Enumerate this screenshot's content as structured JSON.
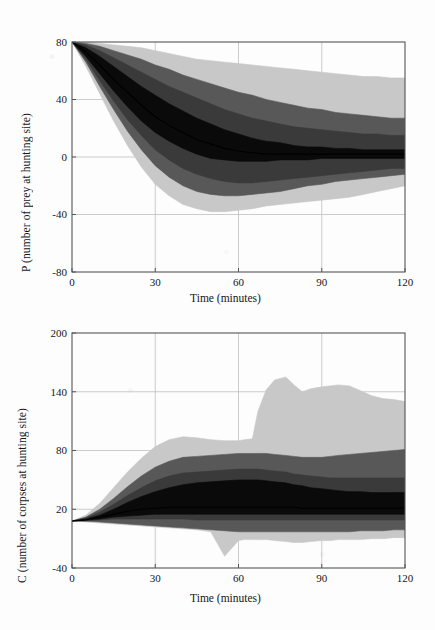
{
  "figure": {
    "background_color": "#fdfdfd",
    "band_colors": {
      "outer": "#c8c8c8",
      "mid": "#585858",
      "inner": "#3a3a3a",
      "core": "#0a0a0a",
      "median": "#000000",
      "grid": "#bfbfbf",
      "axis": "#555555"
    }
  },
  "chart_data": [
    {
      "id": "prey-panel",
      "type": "area",
      "title": "",
      "xlabel": "Time (minutes)",
      "ylabel": "P (number of prey at hunting site)",
      "xlim": [
        0,
        120
      ],
      "ylim": [
        -80,
        80
      ],
      "xticks": [
        0,
        30,
        60,
        90,
        120
      ],
      "yticks": [
        -80,
        -40,
        0,
        40,
        80
      ],
      "xtick_labels": [
        "0",
        "30",
        "60",
        "90",
        "120"
      ],
      "ytick_labels": [
        "-80",
        "-40",
        "0",
        "40",
        "80"
      ],
      "grid": true,
      "legend": "none",
      "x": [
        0,
        5,
        10,
        15,
        20,
        25,
        30,
        35,
        40,
        45,
        50,
        55,
        60,
        65,
        70,
        75,
        80,
        85,
        90,
        95,
        100,
        105,
        110,
        115,
        120
      ],
      "series": [
        {
          "name": "outer band upper",
          "shade": "#c8c8c8",
          "values": [
            80,
            80,
            79,
            78,
            77,
            76,
            74,
            72,
            70,
            68,
            67,
            66,
            65,
            64,
            63,
            62,
            61,
            60,
            59,
            58,
            57,
            56,
            56,
            55,
            55
          ]
        },
        {
          "name": "mid band upper",
          "shade": "#585858",
          "values": [
            80,
            79,
            77,
            74,
            71,
            68,
            64,
            61,
            57,
            54,
            51,
            48,
            45,
            43,
            40,
            38,
            36,
            34,
            33,
            31,
            30,
            29,
            28,
            27,
            27
          ]
        },
        {
          "name": "inner band upper",
          "shade": "#3a3a3a",
          "values": [
            80,
            78,
            74,
            69,
            64,
            59,
            54,
            49,
            45,
            41,
            37,
            33,
            30,
            27,
            25,
            23,
            21,
            20,
            19,
            18,
            17,
            16,
            16,
            15,
            15
          ]
        },
        {
          "name": "core band upper",
          "shade": "#0a0a0a",
          "values": [
            80,
            76,
            70,
            63,
            56,
            49,
            43,
            37,
            32,
            27,
            23,
            19,
            16,
            13,
            11,
            10,
            8,
            7,
            7,
            6,
            6,
            5,
            5,
            5,
            5
          ]
        },
        {
          "name": "median",
          "shade": "#000000",
          "values": [
            80,
            73,
            64,
            54,
            45,
            36,
            28,
            22,
            17,
            12,
            9,
            6,
            4,
            3,
            2,
            2,
            2,
            2,
            2,
            2,
            2,
            2,
            2,
            2,
            2
          ]
        },
        {
          "name": "core band lower",
          "shade": "#0a0a0a",
          "values": [
            80,
            70,
            58,
            46,
            35,
            25,
            17,
            11,
            6,
            2,
            -1,
            -2,
            -3,
            -3,
            -3,
            -2,
            -2,
            -2,
            -1,
            -1,
            -1,
            -1,
            -1,
            -1,
            -1
          ]
        },
        {
          "name": "inner band lower",
          "shade": "#3a3a3a",
          "values": [
            80,
            68,
            53,
            39,
            26,
            15,
            5,
            -2,
            -8,
            -12,
            -15,
            -17,
            -18,
            -18,
            -17,
            -16,
            -15,
            -14,
            -13,
            -12,
            -11,
            -10,
            -9,
            -8,
            -8
          ]
        },
        {
          "name": "mid band lower",
          "shade": "#585858",
          "values": [
            80,
            66,
            49,
            33,
            18,
            5,
            -6,
            -14,
            -20,
            -24,
            -26,
            -27,
            -27,
            -26,
            -25,
            -24,
            -22,
            -20,
            -19,
            -17,
            -16,
            -15,
            -14,
            -13,
            -12
          ]
        },
        {
          "name": "outer band lower",
          "shade": "#c8c8c8",
          "values": [
            80,
            63,
            44,
            25,
            8,
            -7,
            -19,
            -27,
            -33,
            -36,
            -38,
            -38,
            -37,
            -36,
            -34,
            -33,
            -32,
            -31,
            -30,
            -29,
            -28,
            -26,
            -24,
            -22,
            -20
          ]
        }
      ]
    },
    {
      "id": "corpses-panel",
      "type": "area",
      "title": "",
      "xlabel": "Time (minutes)",
      "ylabel": "C (number of corpses at hunting site)",
      "xlim": [
        0,
        120
      ],
      "ylim": [
        -40,
        200
      ],
      "xticks": [
        0,
        30,
        60,
        90,
        120
      ],
      "yticks": [
        -40,
        20,
        80,
        140,
        200
      ],
      "xtick_labels": [
        "0",
        "30",
        "60",
        "90",
        "120"
      ],
      "ytick_labels": [
        "-40",
        "20",
        "80",
        "140",
        "200"
      ],
      "grid": true,
      "legend": "none",
      "x": [
        0,
        5,
        10,
        15,
        20,
        25,
        30,
        35,
        40,
        45,
        50,
        55,
        60,
        62,
        65,
        67,
        70,
        73,
        77,
        80,
        83,
        86,
        90,
        93,
        96,
        100,
        104,
        108,
        112,
        116,
        120
      ],
      "series": [
        {
          "name": "outer band upper",
          "shade": "#c8c8c8",
          "values": [
            8,
            14,
            26,
            42,
            58,
            72,
            84,
            91,
            94,
            93,
            91,
            90,
            90,
            91,
            92,
            120,
            142,
            152,
            155,
            147,
            140,
            143,
            145,
            146,
            147,
            146,
            141,
            136,
            133,
            132,
            130
          ]
        },
        {
          "name": "mid band upper",
          "shade": "#585858",
          "values": [
            8,
            12,
            20,
            31,
            43,
            54,
            63,
            69,
            73,
            74,
            75,
            76,
            77,
            77,
            77,
            77,
            77,
            76,
            75,
            74,
            73,
            73,
            73,
            74,
            75,
            76,
            77,
            78,
            79,
            80,
            81
          ]
        },
        {
          "name": "inner band upper",
          "shade": "#3a3a3a",
          "values": [
            8,
            11,
            17,
            25,
            34,
            42,
            49,
            54,
            57,
            58,
            59,
            60,
            61,
            61,
            61,
            61,
            60,
            59,
            58,
            56,
            55,
            54,
            53,
            52,
            52,
            52,
            52,
            52,
            52,
            52,
            52
          ]
        },
        {
          "name": "core band upper",
          "shade": "#0a0a0a",
          "values": [
            8,
            10,
            14,
            20,
            27,
            33,
            38,
            42,
            45,
            47,
            48,
            49,
            50,
            50,
            50,
            50,
            49,
            48,
            47,
            45,
            44,
            42,
            41,
            40,
            39,
            38,
            38,
            37,
            37,
            37,
            37
          ]
        },
        {
          "name": "median",
          "shade": "#000000",
          "values": [
            8,
            9,
            12,
            15,
            18,
            20,
            21,
            22,
            22,
            22,
            22,
            22,
            22,
            22,
            22,
            22,
            22,
            22,
            22,
            22,
            21,
            21,
            21,
            21,
            21,
            21,
            21,
            21,
            21,
            21,
            21
          ]
        },
        {
          "name": "core band lower",
          "shade": "#0a0a0a",
          "values": [
            8,
            9,
            10,
            12,
            13,
            14,
            15,
            15,
            15,
            15,
            15,
            15,
            15,
            15,
            15,
            15,
            15,
            15,
            15,
            15,
            15,
            15,
            15,
            15,
            15,
            15,
            15,
            15,
            15,
            15,
            15
          ]
        },
        {
          "name": "inner band lower",
          "shade": "#3a3a3a",
          "values": [
            8,
            8,
            9,
            10,
            10,
            10,
            10,
            10,
            10,
            9,
            9,
            9,
            9,
            9,
            9,
            9,
            9,
            9,
            9,
            9,
            9,
            9,
            9,
            9,
            9,
            9,
            9,
            9,
            9,
            9,
            9
          ]
        },
        {
          "name": "mid band lower",
          "shade": "#585858",
          "values": [
            8,
            8,
            7,
            6,
            5,
            4,
            3,
            2,
            1,
            0,
            -1,
            -2,
            -3,
            -3,
            -3,
            -3,
            -3,
            -3,
            -3,
            -3,
            -3,
            -3,
            -3,
            -3,
            -3,
            -3,
            -2,
            -2,
            -2,
            -1,
            -1
          ]
        },
        {
          "name": "outer band lower",
          "shade": "#c8c8c8",
          "values": [
            8,
            7,
            6,
            5,
            4,
            3,
            2,
            1,
            0,
            -1,
            -3,
            -28,
            -12,
            -11,
            -11,
            -11,
            -11,
            -12,
            -13,
            -14,
            -14,
            -13,
            -12,
            -12,
            -11,
            -11,
            -11,
            -10,
            -10,
            -9,
            -9
          ]
        }
      ]
    }
  ]
}
